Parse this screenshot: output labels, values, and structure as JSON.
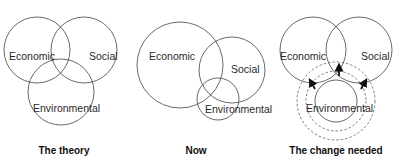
{
  "panels": [
    {
      "caption": "The theory",
      "circles": {
        "economic": "Economic",
        "social": "Social",
        "environmental": "Environmental"
      }
    },
    {
      "caption": "Now",
      "circles": {
        "economic": "Economic",
        "social": "Social",
        "environmental": "Environmental"
      }
    },
    {
      "caption": "The change needed",
      "circles": {
        "economic": "Economic",
        "social": "Social",
        "environmental": "Environmental"
      },
      "arrows": [
        "arrow-up-left",
        "arrow-up",
        "arrow-up-right"
      ]
    }
  ],
  "colors": {
    "stroke": "#444444",
    "text": "#2a2a2a",
    "background": "#ffffff"
  }
}
